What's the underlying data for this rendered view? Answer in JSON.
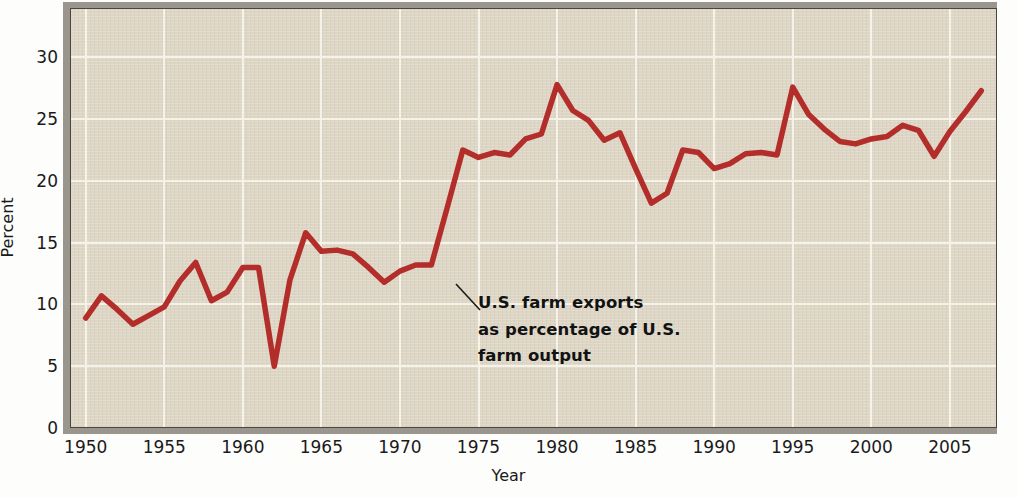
{
  "chart_data": {
    "type": "line",
    "title": "",
    "xlabel": "Year",
    "ylabel": "Percent",
    "xlim": [
      1949,
      2008
    ],
    "ylim": [
      0,
      34
    ],
    "grid": true,
    "legend": "none",
    "series_name": "U.S. farm exports as percentage of U.S. farm output",
    "line_color": "#b32d2a",
    "background_color": "#ded6c5",
    "gridline_color": "#f5f2ea",
    "x": [
      1950,
      1951,
      1952,
      1953,
      1954,
      1955,
      1956,
      1957,
      1958,
      1959,
      1960,
      1961,
      1962,
      1963,
      1964,
      1965,
      1966,
      1967,
      1968,
      1969,
      1970,
      1971,
      1972,
      1973,
      1974,
      1975,
      1976,
      1977,
      1978,
      1979,
      1980,
      1981,
      1982,
      1983,
      1984,
      1985,
      1986,
      1987,
      1988,
      1989,
      1990,
      1991,
      1992,
      1993,
      1994,
      1995,
      1996,
      1997,
      1998,
      1999,
      2000,
      2001,
      2002,
      2003,
      2004,
      2005,
      2006,
      2007
    ],
    "values": [
      8.9,
      10.7,
      9.6,
      8.4,
      9.1,
      9.8,
      11.9,
      13.4,
      10.3,
      11.0,
      13.0,
      13.0,
      5.0,
      12.0,
      15.8,
      14.3,
      14.4,
      14.1,
      13.0,
      11.8,
      12.7,
      13.2,
      13.2,
      17.8,
      22.5,
      21.9,
      22.3,
      22.1,
      23.4,
      23.8,
      27.8,
      25.7,
      24.9,
      23.3,
      23.9,
      21.0,
      18.2,
      19.0,
      22.5,
      22.3,
      21.0,
      21.4,
      22.2,
      22.3,
      22.1,
      27.6,
      25.4,
      24.2,
      23.2,
      23.0,
      23.4,
      23.6,
      24.5,
      24.1,
      22.0,
      24.0,
      25.6,
      27.3
    ],
    "annotation": {
      "line1": "U.S. farm exports",
      "line2": "as percentage of U.S.",
      "line3": "farm output",
      "points_to_year": 1972
    },
    "yticks": [
      0,
      5,
      10,
      15,
      20,
      25,
      30
    ],
    "xticks": [
      1950,
      1955,
      1960,
      1965,
      1970,
      1975,
      1980,
      1985,
      1990,
      1995,
      2000,
      2005
    ]
  }
}
